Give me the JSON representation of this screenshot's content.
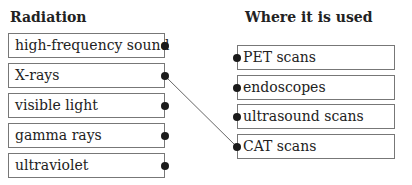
{
  "left_column": {
    "heading": "Radiation",
    "items": [
      {
        "label": "high-frequency sound"
      },
      {
        "label": "X-rays"
      },
      {
        "label": "visible light"
      },
      {
        "label": "gamma rays"
      },
      {
        "label": "ultraviolet"
      }
    ]
  },
  "right_column": {
    "heading": "Where it is used",
    "items": [
      {
        "label": "PET scans"
      },
      {
        "label": "endoscopes"
      },
      {
        "label": "ultrasound scans"
      },
      {
        "label": "CAT scans"
      }
    ]
  },
  "connections": [
    {
      "from": "X-rays",
      "to": "CAT scans"
    }
  ]
}
